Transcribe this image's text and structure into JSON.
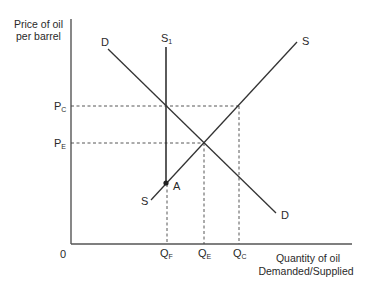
{
  "diagram": {
    "type": "supply-demand",
    "y_axis_label": [
      "Price of oil",
      "per barrel"
    ],
    "x_axis_label": [
      "Quantity of oil",
      "Demanded/Supplied"
    ],
    "origin_label": "0",
    "price_labels": {
      "pc": {
        "main": "P",
        "sub": "C"
      },
      "pe": {
        "main": "P",
        "sub": "E"
      }
    },
    "quantity_labels": {
      "qf": {
        "main": "Q",
        "sub": "F"
      },
      "qe": {
        "main": "Q",
        "sub": "E"
      },
      "qc": {
        "main": "Q",
        "sub": "C"
      }
    },
    "curves": {
      "demand": {
        "label_top": "D",
        "label_bottom": "D"
      },
      "supply": {
        "label_top": "S",
        "label_bottom": "S"
      },
      "supply_fixed": {
        "main": "S",
        "sub": "1"
      }
    },
    "point_a": "A",
    "colors": {
      "line": "#333333",
      "axis": "#555555",
      "text": "#2a2a2a",
      "background": "#ffffff"
    }
  }
}
